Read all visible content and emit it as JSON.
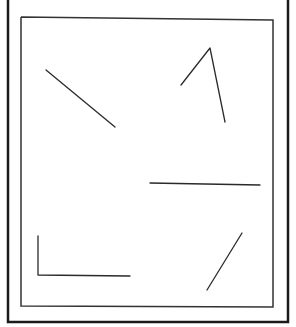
{
  "diagram": {
    "colors": {
      "background": "#ffffff",
      "outer_frame": "#1a1a1a",
      "inner_frame": "#333333",
      "stroke": "#2a2a2a"
    },
    "outer_frame": {
      "points": "8,0 8,322 288,322 288,0",
      "stroke_width": 2.5
    },
    "inner_frame": {
      "points": "21,17 273,20 273,307 21,306 21,17",
      "stroke_width": 1.5
    },
    "elements": [
      {
        "id": "diagonal-line-upper-left",
        "type": "line",
        "points": "46,70 115,127"
      },
      {
        "id": "angle-upper-right",
        "type": "polyline",
        "points": "181,85 210,48 225,122"
      },
      {
        "id": "horizontal-line-middle-right",
        "type": "line",
        "points": "150,183 260,185"
      },
      {
        "id": "right-angle-lower-left",
        "type": "polyline",
        "points": "38,236 38,275 130,276"
      },
      {
        "id": "diagonal-line-lower-right",
        "type": "line",
        "points": "242,233 207,290"
      }
    ]
  }
}
